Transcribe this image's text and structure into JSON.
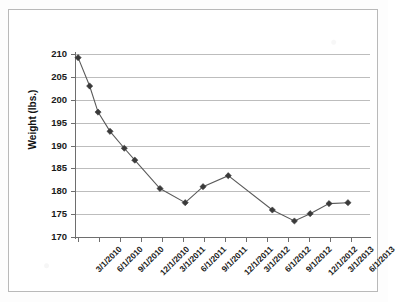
{
  "chart_data": {
    "type": "line",
    "title": "",
    "xlabel": "",
    "ylabel": "Weight (lbs.)",
    "ylim": [
      170,
      210
    ],
    "ytick_step": 5,
    "yticks": [
      210,
      205,
      200,
      195,
      190,
      185,
      180,
      175,
      170
    ],
    "xtick_labels": [
      "3/1/2010",
      "6/1/2010",
      "9/1/2010",
      "12/1/2010",
      "3/1/2011",
      "6/1/2011",
      "9/1/2011",
      "12/1/2011",
      "3/1/2012",
      "6/1/2012",
      "9/1/2012",
      "12/1/2012",
      "3/1/2013",
      "6/1/2013"
    ],
    "grid": true,
    "grid_axis": "y",
    "legend": false,
    "marker": "diamond",
    "marker_color": "#3a3a3a",
    "line_color": "#5a5a5a",
    "series": [
      {
        "name": "Weight",
        "points": [
          {
            "x": 0.0,
            "y": 209.2
          },
          {
            "x": 0.55,
            "y": 203.0
          },
          {
            "x": 0.95,
            "y": 197.3
          },
          {
            "x": 1.52,
            "y": 193.1
          },
          {
            "x": 2.2,
            "y": 189.4
          },
          {
            "x": 2.7,
            "y": 186.8
          },
          {
            "x": 3.9,
            "y": 180.6
          },
          {
            "x": 5.1,
            "y": 177.5
          },
          {
            "x": 5.95,
            "y": 181.0
          },
          {
            "x": 7.15,
            "y": 183.4
          },
          {
            "x": 9.25,
            "y": 175.9
          },
          {
            "x": 10.3,
            "y": 173.5
          },
          {
            "x": 11.05,
            "y": 175.1
          },
          {
            "x": 11.95,
            "y": 177.3
          },
          {
            "x": 12.85,
            "y": 177.5
          }
        ]
      }
    ]
  },
  "axis": {
    "y_title": "Weight (lbs.)"
  }
}
